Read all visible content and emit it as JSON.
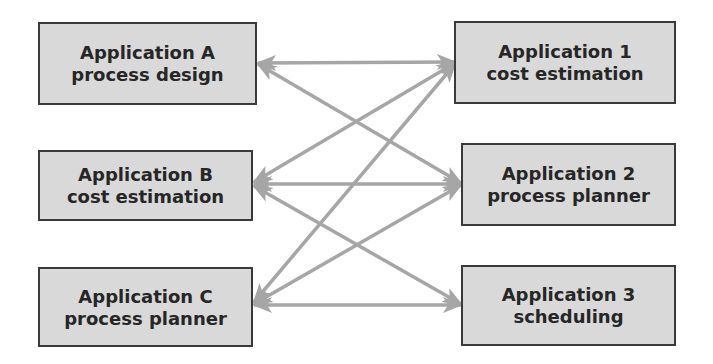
{
  "diagram": {
    "colors": {
      "box_fill": "#d9d9d9",
      "box_border": "#3a3a3a",
      "text": "#262626",
      "arrow": "#a6a6a6",
      "background": "#ffffff"
    },
    "left_nodes": [
      {
        "id": "A",
        "title": "Application A",
        "subtitle": "process design"
      },
      {
        "id": "B",
        "title": "Application B",
        "subtitle": "cost estimation"
      },
      {
        "id": "C",
        "title": "Application C",
        "subtitle": "process planner"
      }
    ],
    "right_nodes": [
      {
        "id": "1",
        "title": "Application 1",
        "subtitle": "cost estimation"
      },
      {
        "id": "2",
        "title": "Application 2",
        "subtitle": "process planner"
      },
      {
        "id": "3",
        "title": "Application 3",
        "subtitle": "scheduling"
      }
    ],
    "connections": [
      {
        "from": "A",
        "to": "1",
        "bidirectional": true
      },
      {
        "from": "A",
        "to": "2",
        "bidirectional": true
      },
      {
        "from": "B",
        "to": "1",
        "bidirectional": true
      },
      {
        "from": "B",
        "to": "2",
        "bidirectional": true
      },
      {
        "from": "B",
        "to": "3",
        "bidirectional": true
      },
      {
        "from": "C",
        "to": "1",
        "bidirectional": true
      },
      {
        "from": "C",
        "to": "2",
        "bidirectional": true
      },
      {
        "from": "C",
        "to": "3",
        "bidirectional": true
      }
    ]
  }
}
